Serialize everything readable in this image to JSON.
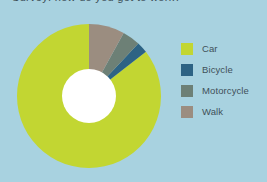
{
  "background_color": "#a8d2e0",
  "title": {
    "text": "Survey: how do you get to work?",
    "visible_fragment": "clipped-descenders-only"
  },
  "legend": {
    "position": "right",
    "items": [
      {
        "label": "Car",
        "color": "#c2d632"
      },
      {
        "label": "Bicycle",
        "color": "#2d6384"
      },
      {
        "label": "Motorcycle",
        "color": "#6d8076"
      },
      {
        "label": "Walk",
        "color": "#9b8d80"
      }
    ]
  },
  "chart_data": {
    "type": "pie",
    "variant": "donut",
    "title": "Survey: how do you get to work?",
    "xlabel": "",
    "ylabel": "",
    "grid": false,
    "legend_position": "right",
    "start_angle_deg": 0,
    "direction": "counterclockwise",
    "inner_radius_ratio": 0.375,
    "center_px": {
      "x": 89,
      "y": 96
    },
    "outer_radius_px": 72,
    "inner_radius_px": 27,
    "labels": [
      "Car",
      "Bicycle",
      "Motorcycle",
      "Walk"
    ],
    "values": [
      85.5,
      2.5,
      4.0,
      8.0
    ],
    "colors": [
      "#c2d632",
      "#2d6384",
      "#6d8076",
      "#9b8d80"
    ],
    "slices": [
      {
        "label": "Car",
        "value": 85.5,
        "color": "#c2d632",
        "angle_deg": 307.8
      },
      {
        "label": "Bicycle",
        "value": 2.5,
        "color": "#2d6384",
        "angle_deg": 9.0
      },
      {
        "label": "Motorcycle",
        "value": 4.0,
        "color": "#6d8076",
        "angle_deg": 14.4
      },
      {
        "label": "Walk",
        "value": 8.0,
        "color": "#9b8d80",
        "angle_deg": 28.8
      }
    ],
    "units": "percent",
    "total": 100
  }
}
